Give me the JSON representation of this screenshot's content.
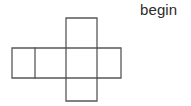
{
  "page": {
    "background_color": "#ffffff",
    "width": 191,
    "height": 106
  },
  "label": {
    "begin_text": "begin",
    "color": "#2b2b2b",
    "x": 140,
    "y": 1,
    "font_size": 15
  },
  "figure": {
    "name": "cube-net",
    "stroke_color": "#585858",
    "stroke_width": 1.3,
    "fill_color": "none",
    "square_count": 5,
    "squares": [
      {
        "id": "left-outer",
        "x": 12,
        "y": 48,
        "width": 23,
        "height": 30
      },
      {
        "id": "left-inner",
        "x": 35,
        "y": 48,
        "width": 31,
        "height": 30
      },
      {
        "id": "center",
        "x": 66,
        "y": 48,
        "width": 31,
        "height": 30
      },
      {
        "id": "right",
        "x": 97,
        "y": 48,
        "width": 24,
        "height": 30
      },
      {
        "id": "top",
        "x": 66,
        "y": 18,
        "width": 31,
        "height": 30
      },
      {
        "id": "bottom",
        "x": 66,
        "y": 78,
        "width": 31,
        "height": 23
      }
    ],
    "outline_path": "M66,18 L97,18 L97,48 L121,48 L121,78 L97,78 L97,101 L66,101 L66,78 L12,78 L12,48 L66,48 Z",
    "interior_lines": [
      {
        "id": "divider-left-outer",
        "x1": 35,
        "y1": 48,
        "x2": 35,
        "y2": 78
      },
      {
        "id": "divider-center-left",
        "x1": 66,
        "y1": 48,
        "x2": 66,
        "y2": 78
      },
      {
        "id": "divider-center-right",
        "x1": 97,
        "y1": 48,
        "x2": 97,
        "y2": 78
      },
      {
        "id": "divider-top-row",
        "x1": 66,
        "y1": 48,
        "x2": 97,
        "y2": 48
      },
      {
        "id": "divider-bottom-row",
        "x1": 66,
        "y1": 78,
        "x2": 97,
        "y2": 78
      }
    ]
  }
}
